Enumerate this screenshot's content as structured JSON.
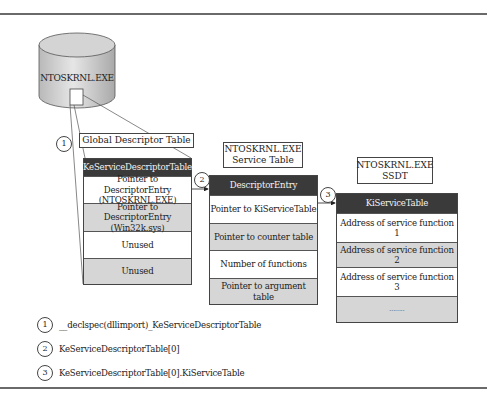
{
  "diagram": {
    "cylinder": {
      "label": "NTOSKRNL.EXE"
    },
    "gdt_label": "Global Descriptor Table",
    "left_table": {
      "header": "KeServiceDescriptorTable",
      "rows": [
        {
          "line1": "Pointer to DescriptorEntry",
          "line2": "(NTOSKRNL.EXE)"
        },
        {
          "line1": "Pointer to DescriptorEntry",
          "line2": "(Win32k.sys)"
        },
        {
          "line1": "Unused",
          "line2": ""
        },
        {
          "line1": "Unused",
          "line2": ""
        }
      ]
    },
    "middle_label": {
      "line1": "NTOSKRNL.EXE",
      "line2": "Service Table"
    },
    "middle_table": {
      "header": "DescriptorEntry",
      "rows": [
        "Pointer to KiServiceTable",
        "Pointer to counter table",
        "Number of functions",
        "Pointer to argument table"
      ]
    },
    "right_label": {
      "line1": "NTOSKRNL.EXE",
      "line2": "SSDT"
    },
    "right_table": {
      "header": "KiServiceTable",
      "rows": [
        "Address of service function 1",
        "Address of service function 2",
        "Address of service function 3",
        "........"
      ]
    },
    "markers": [
      "1",
      "2",
      "3"
    ]
  },
  "legend": [
    {
      "num": "1",
      "text": "__declspec(dllimport)_KeServiceDescriptorTable"
    },
    {
      "num": "2",
      "text": "KeServiceDescriptorTable[0]"
    },
    {
      "num": "3",
      "text": "KeServiceDescriptorTable[0].KiServiceTable"
    }
  ],
  "colors": {
    "header_fill": "#3a3a3a",
    "shaded_row": "#d6d6d6",
    "cylinder_fill": "#c8c8c8",
    "rule": "#6a6a6a"
  }
}
